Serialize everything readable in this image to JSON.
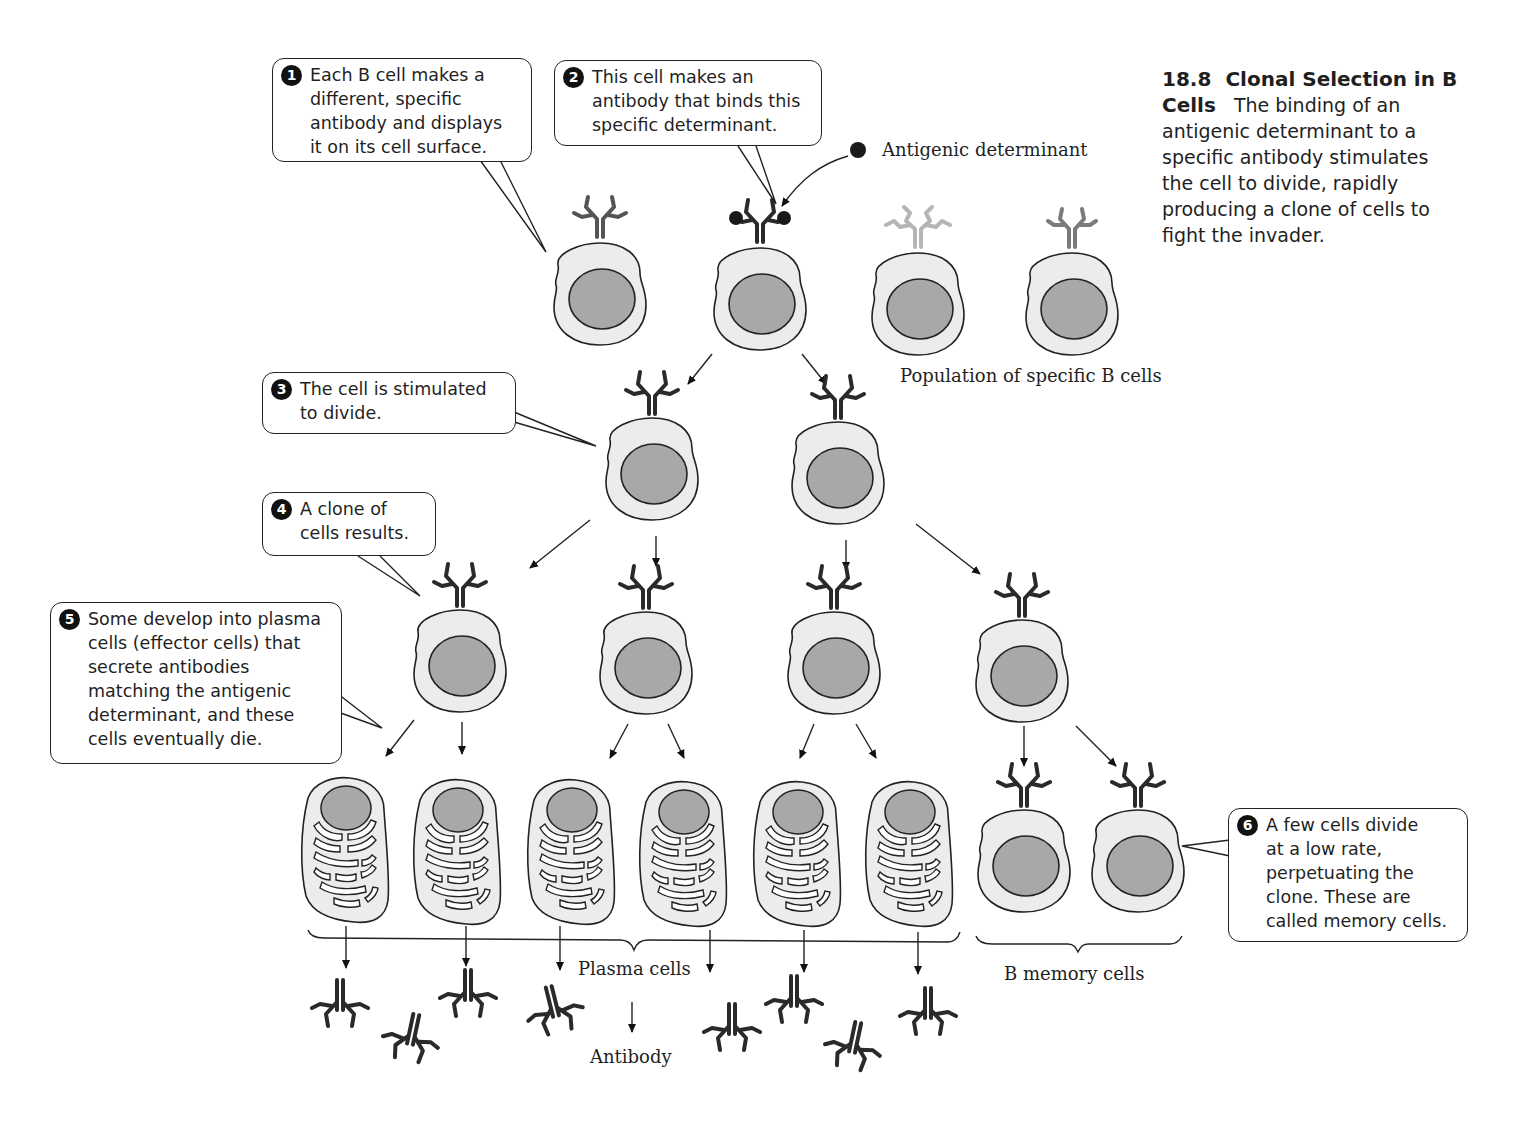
{
  "figure": {
    "number": "18.8",
    "title": "Clonal Selection in B Cells",
    "caption_body": "The binding of an antigenic determinant to a specific antibody stimulates the cell to divide, rapidly producing a clone of cells to fight the invader."
  },
  "callouts": [
    {
      "num": "1",
      "text": "Each B cell makes a\ndifferent, specific\nantibody and displays\nit on its cell surface."
    },
    {
      "num": "2",
      "text": "This cell makes an\nantibody that binds this\nspecific determinant."
    },
    {
      "num": "3",
      "text": "The cell is stimulated\nto divide."
    },
    {
      "num": "4",
      "text": "A clone of\ncells results."
    },
    {
      "num": "5",
      "text": "Some develop into plasma\ncells (effector cells) that\nsecrete antibodies\nmatching the antigenic\ndeterminant, and these\ncells eventually die."
    },
    {
      "num": "6",
      "text": "A few cells divide\nat a low rate,\nperpetuating the\nclone. These are\ncalled memory cells."
    }
  ],
  "labels": {
    "antigenic_determinant": "Antigenic determinant",
    "population": "Population of specific B cells",
    "plasma_cells": "Plasma cells",
    "memory_cells": "B memory cells",
    "antibody": "Antibody"
  },
  "colors": {
    "cytoplasm": "#ececec",
    "nucleus": "#a8a8a8",
    "outline": "#222222",
    "antibody_dark": "#2a2a2a",
    "antibody_mid": "#7a7a7a",
    "antibody_light": "#b5b5b5"
  }
}
